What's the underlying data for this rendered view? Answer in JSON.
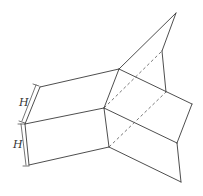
{
  "diagram": {
    "type": "geometry-folded-planes",
    "labels": [
      {
        "id": "dim-upper",
        "text": "H",
        "x": 19,
        "y": 106
      },
      {
        "id": "dim-lower",
        "text": "H",
        "x": 13,
        "y": 148
      }
    ],
    "stroke_color": "#3a3a3a",
    "dash_color": "#555555"
  }
}
